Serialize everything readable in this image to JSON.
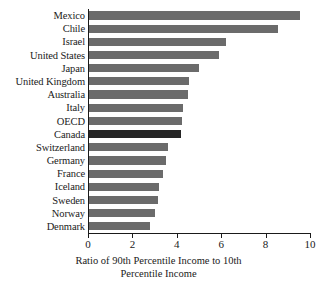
{
  "chart_data": {
    "type": "bar",
    "orientation": "horizontal",
    "title": "",
    "xlabel": "Ratio of 90th Percentile Income to 10th Percentile Income",
    "xlabel_lines": [
      "Ratio of 90th Percentile Income to 10th",
      "Percentile Income"
    ],
    "ylabel": "",
    "xlim": [
      0,
      10
    ],
    "grid": false,
    "legend": null,
    "xticks": [
      0,
      2,
      4,
      6,
      8,
      10
    ],
    "xtick_labels": [
      "0",
      "2",
      "4",
      "6",
      "8",
      "10"
    ],
    "categories": [
      "Mexico",
      "Chile",
      "Israel",
      "United States",
      "Japan",
      "United Kingdom",
      "Australia",
      "Italy",
      "OECD",
      "Canada",
      "Switzerland",
      "Germany",
      "France",
      "Iceland",
      "Sweden",
      "Norway",
      "Denmark"
    ],
    "values": [
      9.55,
      8.55,
      6.2,
      5.9,
      5.0,
      4.55,
      4.5,
      4.3,
      4.25,
      4.2,
      3.6,
      3.5,
      3.4,
      3.2,
      3.15,
      3.0,
      2.8
    ],
    "highlight_category": "Canada",
    "colors": {
      "bar": "#6b6b6b",
      "bar_highlight": "#262626",
      "axis": "#1a1a1a",
      "background": "#ffffff",
      "text": "#1a1a1a"
    }
  }
}
